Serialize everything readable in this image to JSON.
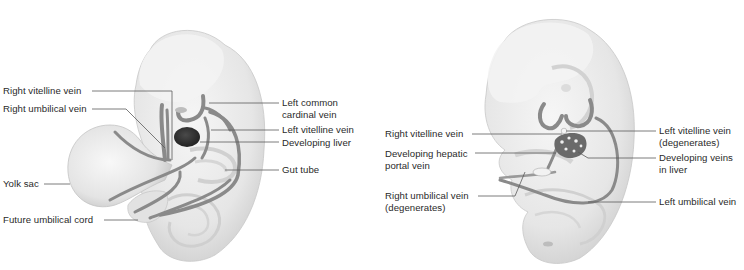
{
  "figure": {
    "panels": [
      {
        "id": "early",
        "description": "Early embryo showing paired vitelline and umbilical veins",
        "labels": [
          {
            "text": "Right vitelline vein",
            "side": "left"
          },
          {
            "text": "Right umbilical vein",
            "side": "left"
          },
          {
            "text": "Yolk sac",
            "side": "left"
          },
          {
            "text": "Future umbilical cord",
            "side": "left"
          },
          {
            "text": "Left common\ncardinal vein",
            "line1": "Left common",
            "line2": "cardinal vein",
            "side": "right"
          },
          {
            "text": "Left vitelline vein",
            "side": "right"
          },
          {
            "text": "Developing liver",
            "side": "right"
          },
          {
            "text": "Gut tube",
            "side": "right"
          }
        ]
      },
      {
        "id": "later",
        "description": "Later embryo showing developing hepatic portal system",
        "labels": [
          {
            "text": "Right vitelline vein",
            "side": "left"
          },
          {
            "line1": "Developing hepatic",
            "line2": "portal vein",
            "side": "left"
          },
          {
            "line1": "Right umbilical vein",
            "line2": "(degenerates)",
            "side": "left"
          },
          {
            "line1": "Left vitelline vein",
            "line2": "(degenerates)",
            "side": "right"
          },
          {
            "line1": "Developing veins",
            "line2": "in liver",
            "side": "right"
          },
          {
            "text": "Left umbilical vein",
            "side": "right"
          }
        ]
      }
    ],
    "colors": {
      "embryo_fill": "#ececec",
      "embryo_shade": "#d6d6d6",
      "vein": "#8a8a8a",
      "vein_dark": "#6e6e6e",
      "liver": "#3a3a3a",
      "leader_line": "#5a5a5a",
      "text": "#2a2a2a"
    }
  }
}
